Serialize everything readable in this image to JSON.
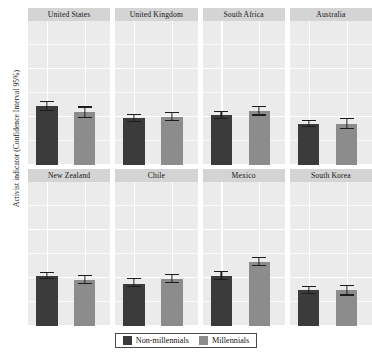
{
  "chart_data": {
    "type": "bar",
    "title": "",
    "xlabel": "",
    "ylabel": "Activist indicator (Confidence Interval 95%)",
    "ylim": [
      0,
      6
    ],
    "yticks": [
      0,
      2,
      4,
      6
    ],
    "ytick_labels": [
      "0",
      "2",
      "4",
      "6"
    ],
    "grid": true,
    "legend_position": "bottom",
    "facet_layout": {
      "rows": 2,
      "cols": 4
    },
    "categories": [
      "Non-millennials",
      "Millennials"
    ],
    "series": [
      {
        "name": "Non-millennials",
        "color": "#3b3b3b"
      },
      {
        "name": "Millennials",
        "color": "#8c8c8c"
      }
    ],
    "panels": [
      {
        "label": "United States",
        "bars": [
          {
            "group": "Non-millennials",
            "value": 2.45,
            "ci_low": 2.25,
            "ci_high": 2.66
          },
          {
            "group": "Millennials",
            "value": 2.2,
            "ci_low": 1.96,
            "ci_high": 2.44
          }
        ]
      },
      {
        "label": "United Kingdom",
        "bars": [
          {
            "group": "Non-millennials",
            "value": 1.95,
            "ci_low": 1.79,
            "ci_high": 2.14
          },
          {
            "group": "Millennials",
            "value": 2.0,
            "ci_low": 1.84,
            "ci_high": 2.2
          }
        ]
      },
      {
        "label": "South Africa",
        "bars": [
          {
            "group": "Non-millennials",
            "value": 2.08,
            "ci_low": 1.93,
            "ci_high": 2.26
          },
          {
            "group": "Millennials",
            "value": 2.25,
            "ci_low": 2.06,
            "ci_high": 2.45
          }
        ]
      },
      {
        "label": "Australia",
        "bars": [
          {
            "group": "Non-millennials",
            "value": 1.72,
            "ci_low": 1.58,
            "ci_high": 1.87
          },
          {
            "group": "Millennials",
            "value": 1.72,
            "ci_low": 1.5,
            "ci_high": 1.95
          }
        ]
      },
      {
        "label": "New Zealand",
        "bars": [
          {
            "group": "Non-millennials",
            "value": 2.1,
            "ci_low": 1.95,
            "ci_high": 2.27
          },
          {
            "group": "Millennials",
            "value": 1.92,
            "ci_low": 1.73,
            "ci_high": 2.13
          }
        ]
      },
      {
        "label": "Chile",
        "bars": [
          {
            "group": "Non-millennials",
            "value": 1.77,
            "ci_low": 1.62,
            "ci_high": 1.99
          },
          {
            "group": "Millennials",
            "value": 1.95,
            "ci_low": 1.78,
            "ci_high": 2.18
          }
        ]
      },
      {
        "label": "Mexico",
        "bars": [
          {
            "group": "Non-millennials",
            "value": 2.1,
            "ci_low": 1.93,
            "ci_high": 2.3
          },
          {
            "group": "Millennials",
            "value": 2.68,
            "ci_low": 2.48,
            "ci_high": 2.88
          }
        ]
      },
      {
        "label": "South Korea",
        "bars": [
          {
            "group": "Non-millennials",
            "value": 1.5,
            "ci_low": 1.34,
            "ci_high": 1.68
          },
          {
            "group": "Millennials",
            "value": 1.48,
            "ci_low": 1.27,
            "ci_high": 1.72
          }
        ]
      }
    ]
  },
  "legend": {
    "items": [
      {
        "label": "Non-millennials",
        "color": "#3b3b3b"
      },
      {
        "label": "Millennials",
        "color": "#8c8c8c"
      }
    ]
  },
  "axis": {
    "y_title": "Activist indicator (Confidence Interval 95%)"
  }
}
